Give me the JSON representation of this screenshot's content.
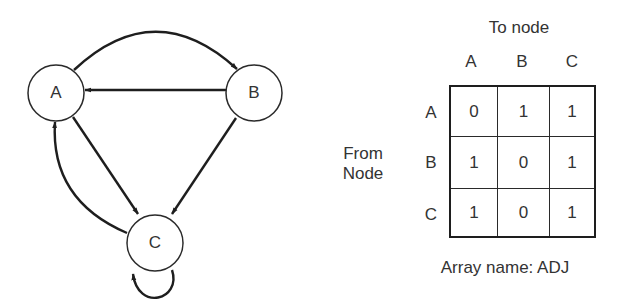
{
  "graph": {
    "nodes": [
      {
        "id": "A",
        "label": "A",
        "cx": 56,
        "cy": 93
      },
      {
        "id": "B",
        "label": "B",
        "cx": 254,
        "cy": 93
      },
      {
        "id": "C",
        "label": "C",
        "cx": 155,
        "cy": 243
      }
    ],
    "edges": [
      {
        "from": "A",
        "to": "B",
        "shape": "arc"
      },
      {
        "from": "B",
        "to": "A",
        "shape": "straight"
      },
      {
        "from": "A",
        "to": "C",
        "shape": "straight"
      },
      {
        "from": "B",
        "to": "C",
        "shape": "straight"
      },
      {
        "from": "C",
        "to": "A",
        "shape": "arc"
      },
      {
        "from": "C",
        "to": "C",
        "shape": "self-loop"
      }
    ]
  },
  "matrix": {
    "title": "To node",
    "side_label_line1": "From",
    "side_label_line2": "Node",
    "column_headers": [
      "A",
      "B",
      "C"
    ],
    "row_headers": [
      "A",
      "B",
      "C"
    ],
    "rows": [
      [
        "0",
        "1",
        "1"
      ],
      [
        "1",
        "0",
        "1"
      ],
      [
        "1",
        "0",
        "1"
      ]
    ],
    "caption": "Array name: ADJ"
  }
}
